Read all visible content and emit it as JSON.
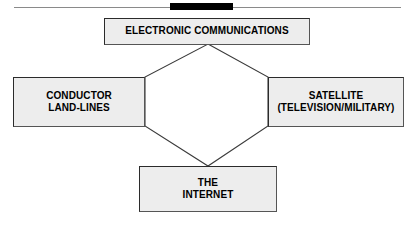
{
  "figure": {
    "background_color": "#ffffff"
  },
  "header": {
    "rule_color": "#8a8a8a",
    "bar_color": "#000000"
  },
  "diagram": {
    "shape": "hexagon-connector",
    "line_color": "#3a3a3a",
    "node_fill": "#ededed",
    "node_border": "#2b2b2b",
    "text_color": "#000000",
    "nodes": [
      {
        "id": "top",
        "name": "electronic-communications",
        "label": "ELECTRONIC COMMUNICATIONS",
        "position": "top"
      },
      {
        "id": "left",
        "name": "conductor-land-lines",
        "label": "CONDUCTOR\nLAND-LINES",
        "position": "left"
      },
      {
        "id": "right",
        "name": "satellite",
        "label": "SATELLITE\n(TELEVISION/MILITARY)",
        "position": "right"
      },
      {
        "id": "bottom",
        "name": "the-internet",
        "label": "THE\nINTERNET",
        "position": "bottom"
      }
    ]
  }
}
